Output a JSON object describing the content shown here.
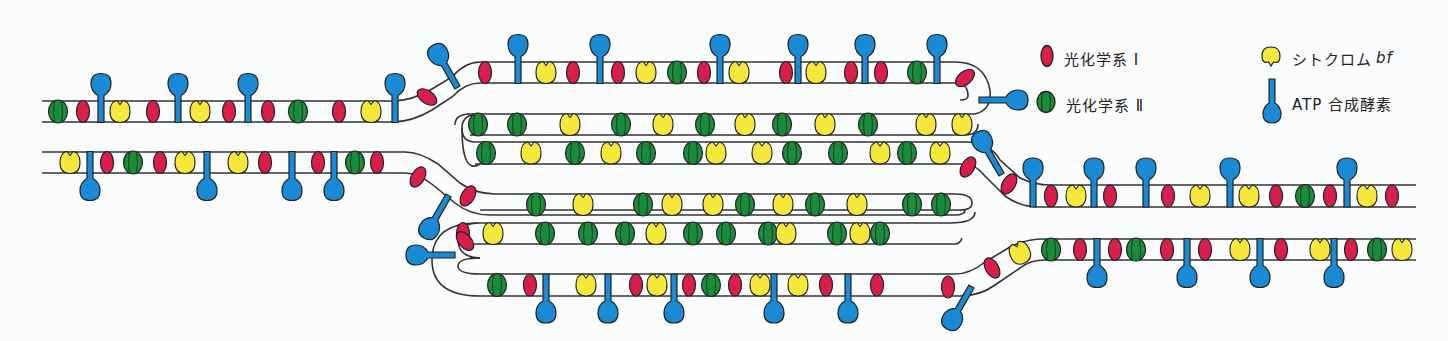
{
  "figure": {
    "colors": {
      "psi": "#d81e4a",
      "psii": "#1e8a3c",
      "cyt": "#f5e83a",
      "atp": "#1a8ad4",
      "stroke": "#222222",
      "membrane": "#333333",
      "background": "#fbfcfd"
    }
  },
  "legend": {
    "items": [
      {
        "key": "psi",
        "label": "光化学系 Ⅰ",
        "icon": "red-oval-icon"
      },
      {
        "key": "psii",
        "label": "光化学系 Ⅱ",
        "icon": "green-striped-oval-icon"
      },
      {
        "key": "cyt",
        "label": "シトクロム",
        "label_italic": "bf",
        "icon": "yellow-notched-icon"
      },
      {
        "key": "atp",
        "label": "ATP 合成酵素",
        "icon": "blue-lollipop-icon"
      }
    ]
  },
  "membranes": {
    "left_upper_lamella": {
      "y_top": 101,
      "y_bot": 122,
      "x_start": 42,
      "x_end": 392,
      "items": [
        {
          "t": "psii",
          "x": 58
        },
        {
          "t": "psi",
          "x": 83
        },
        {
          "t": "atp",
          "x": 101,
          "dir": "up"
        },
        {
          "t": "cyt",
          "x": 120
        },
        {
          "t": "psi",
          "x": 153
        },
        {
          "t": "atp",
          "x": 178,
          "dir": "up"
        },
        {
          "t": "cyt",
          "x": 200
        },
        {
          "t": "psi",
          "x": 229
        },
        {
          "t": "atp",
          "x": 248,
          "dir": "up"
        },
        {
          "t": "psi",
          "x": 268
        },
        {
          "t": "psii",
          "x": 298
        },
        {
          "t": "psi",
          "x": 339
        },
        {
          "t": "cyt",
          "x": 371
        },
        {
          "t": "atp",
          "x": 395,
          "dir": "up"
        }
      ]
    },
    "left_lower_lamella": {
      "y_top": 152,
      "y_bot": 173,
      "x_start": 42,
      "x_end": 405,
      "items": [
        {
          "t": "cyt",
          "x": 70
        },
        {
          "t": "atp",
          "x": 90,
          "dir": "down"
        },
        {
          "t": "psi",
          "x": 107
        },
        {
          "t": "psii",
          "x": 133
        },
        {
          "t": "psi",
          "x": 160
        },
        {
          "t": "cyt",
          "x": 185
        },
        {
          "t": "atp",
          "x": 207,
          "dir": "down"
        },
        {
          "t": "cyt",
          "x": 238
        },
        {
          "t": "psi",
          "x": 265
        },
        {
          "t": "atp",
          "x": 292,
          "dir": "down"
        },
        {
          "t": "psi",
          "x": 318
        },
        {
          "t": "atp",
          "x": 334,
          "dir": "down"
        },
        {
          "t": "psii",
          "x": 355
        },
        {
          "t": "psi",
          "x": 377
        }
      ]
    },
    "granum_top_outer": {
      "y_top": 62,
      "y_bot": 83,
      "x_start": 470,
      "x_end": 955,
      "items": [
        {
          "t": "psi",
          "x": 485
        },
        {
          "t": "atp",
          "x": 518,
          "dir": "up"
        },
        {
          "t": "cyt",
          "x": 546
        },
        {
          "t": "psi",
          "x": 573
        },
        {
          "t": "atp",
          "x": 600,
          "dir": "up"
        },
        {
          "t": "psi",
          "x": 618
        },
        {
          "t": "cyt",
          "x": 646
        },
        {
          "t": "psii",
          "x": 677
        },
        {
          "t": "psi",
          "x": 704
        },
        {
          "t": "atp",
          "x": 720,
          "dir": "up"
        },
        {
          "t": "cyt",
          "x": 739
        },
        {
          "t": "psi",
          "x": 786
        },
        {
          "t": "atp",
          "x": 798,
          "dir": "up"
        },
        {
          "t": "cyt",
          "x": 816
        },
        {
          "t": "psi",
          "x": 851
        },
        {
          "t": "atp",
          "x": 865,
          "dir": "up"
        },
        {
          "t": "psi",
          "x": 881
        },
        {
          "t": "psii",
          "x": 917
        },
        {
          "t": "atp",
          "x": 937,
          "dir": "up"
        }
      ]
    },
    "granum_upper_inner": {
      "y_top": 114,
      "y_bot": 135,
      "x_start": 465,
      "x_end": 960,
      "items": [
        {
          "t": "psii",
          "x": 478
        },
        {
          "t": "psii",
          "x": 517
        },
        {
          "t": "cyt",
          "x": 570
        },
        {
          "t": "psii",
          "x": 621
        },
        {
          "t": "cyt",
          "x": 663
        },
        {
          "t": "psii",
          "x": 705
        },
        {
          "t": "cyt",
          "x": 745
        },
        {
          "t": "psii",
          "x": 782
        },
        {
          "t": "cyt",
          "x": 825
        },
        {
          "t": "psii",
          "x": 868
        },
        {
          "t": "cyt",
          "x": 926
        },
        {
          "t": "cyt",
          "x": 962
        }
      ]
    },
    "granum_mid_a": {
      "y_top": 142,
      "y_bot": 164,
      "x_start": 465,
      "x_end": 960,
      "items": [
        {
          "t": "psii",
          "x": 486
        },
        {
          "t": "cyt",
          "x": 531
        },
        {
          "t": "psii",
          "x": 575
        },
        {
          "t": "cyt",
          "x": 611
        },
        {
          "t": "psii",
          "x": 646
        },
        {
          "t": "psii",
          "x": 693
        },
        {
          "t": "cyt",
          "x": 716
        },
        {
          "t": "cyt",
          "x": 762
        },
        {
          "t": "psii",
          "x": 792
        },
        {
          "t": "psii",
          "x": 838
        },
        {
          "t": "cyt",
          "x": 880
        },
        {
          "t": "psii",
          "x": 907
        },
        {
          "t": "cyt",
          "x": 940
        }
      ]
    },
    "granum_mid_b": {
      "y_top": 194,
      "y_bot": 215,
      "x_start": 470,
      "x_end": 960,
      "items": [
        {
          "t": "psii",
          "x": 536
        },
        {
          "t": "cyt",
          "x": 583
        },
        {
          "t": "psii",
          "x": 643
        },
        {
          "t": "cyt",
          "x": 672
        },
        {
          "t": "cyt",
          "x": 713
        },
        {
          "t": "psii",
          "x": 745
        },
        {
          "t": "cyt",
          "x": 783
        },
        {
          "t": "psii",
          "x": 815
        },
        {
          "t": "cyt",
          "x": 857
        },
        {
          "t": "psii",
          "x": 912
        },
        {
          "t": "psii",
          "x": 941
        }
      ]
    },
    "granum_lower_inner": {
      "y_top": 223,
      "y_bot": 244,
      "x_start": 460,
      "x_end": 960,
      "items": [
        {
          "t": "psi",
          "x": 463
        },
        {
          "t": "cyt",
          "x": 493
        },
        {
          "t": "psii",
          "x": 545
        },
        {
          "t": "psii",
          "x": 588
        },
        {
          "t": "psii",
          "x": 625
        },
        {
          "t": "cyt",
          "x": 656
        },
        {
          "t": "psii",
          "x": 693
        },
        {
          "t": "psii",
          "x": 726
        },
        {
          "t": "psii",
          "x": 768
        },
        {
          "t": "cyt",
          "x": 786
        },
        {
          "t": "psii",
          "x": 837
        },
        {
          "t": "cyt",
          "x": 860
        },
        {
          "t": "psii",
          "x": 880
        }
      ]
    },
    "granum_bottom_outer": {
      "y_top": 274,
      "y_bot": 296,
      "x_start": 470,
      "x_end": 960,
      "items": [
        {
          "t": "psii",
          "x": 497
        },
        {
          "t": "psi",
          "x": 530
        },
        {
          "t": "atp",
          "x": 546,
          "dir": "down"
        },
        {
          "t": "cyt",
          "x": 586
        },
        {
          "t": "atp",
          "x": 608,
          "dir": "down"
        },
        {
          "t": "psi",
          "x": 636
        },
        {
          "t": "cyt",
          "x": 657
        },
        {
          "t": "atp",
          "x": 674,
          "dir": "down"
        },
        {
          "t": "psi",
          "x": 689
        },
        {
          "t": "psii",
          "x": 711
        },
        {
          "t": "psi",
          "x": 735
        },
        {
          "t": "cyt",
          "x": 760
        },
        {
          "t": "atp",
          "x": 774,
          "dir": "down"
        },
        {
          "t": "cyt",
          "x": 798
        },
        {
          "t": "psi",
          "x": 826
        },
        {
          "t": "atp",
          "x": 848,
          "dir": "down"
        },
        {
          "t": "psi",
          "x": 877
        }
      ]
    },
    "right_upper_lamella": {
      "y_top": 185,
      "y_bot": 207,
      "x_start": 1030,
      "x_end": 1416,
      "items": [
        {
          "t": "atp",
          "x": 1033,
          "dir": "up"
        },
        {
          "t": "psi",
          "x": 1051
        },
        {
          "t": "cyt",
          "x": 1076
        },
        {
          "t": "atp",
          "x": 1094,
          "dir": "up"
        },
        {
          "t": "psi",
          "x": 1110
        },
        {
          "t": "atp",
          "x": 1146,
          "dir": "up"
        },
        {
          "t": "psi",
          "x": 1168
        },
        {
          "t": "cyt",
          "x": 1200
        },
        {
          "t": "atp",
          "x": 1230,
          "dir": "up"
        },
        {
          "t": "cyt",
          "x": 1249
        },
        {
          "t": "psi",
          "x": 1276
        },
        {
          "t": "psii",
          "x": 1305
        },
        {
          "t": "psi",
          "x": 1330
        },
        {
          "t": "atp",
          "x": 1347,
          "dir": "up"
        },
        {
          "t": "cyt",
          "x": 1367
        },
        {
          "t": "psi",
          "x": 1392
        }
      ]
    },
    "right_lower_lamella": {
      "y_top": 239,
      "y_bot": 260,
      "x_start": 1030,
      "x_end": 1416,
      "items": [
        {
          "t": "psii",
          "x": 1051
        },
        {
          "t": "psi",
          "x": 1080
        },
        {
          "t": "atp",
          "x": 1097,
          "dir": "down"
        },
        {
          "t": "psi",
          "x": 1115
        },
        {
          "t": "psii",
          "x": 1136
        },
        {
          "t": "psi",
          "x": 1167
        },
        {
          "t": "atp",
          "x": 1187,
          "dir": "down"
        },
        {
          "t": "psi",
          "x": 1205
        },
        {
          "t": "cyt",
          "x": 1240
        },
        {
          "t": "atp",
          "x": 1260,
          "dir": "down"
        },
        {
          "t": "psi",
          "x": 1281
        },
        {
          "t": "cyt",
          "x": 1320
        },
        {
          "t": "atp",
          "x": 1334,
          "dir": "down"
        },
        {
          "t": "psi",
          "x": 1351
        },
        {
          "t": "psii",
          "x": 1377
        },
        {
          "t": "cyt",
          "x": 1402
        }
      ]
    }
  },
  "connectors": {
    "items": [
      {
        "t": "psi",
        "x": 427,
        "y": 97,
        "rot": -55
      },
      {
        "t": "atp",
        "x": 452,
        "y": 78,
        "rot": -30,
        "dir": "up"
      },
      {
        "t": "psi",
        "x": 418,
        "y": 177,
        "rot": 30
      },
      {
        "t": "atp",
        "x": 443,
        "y": 205,
        "rot": 30,
        "dir": "down"
      },
      {
        "t": "psi",
        "x": 468,
        "y": 196,
        "rot": 30
      },
      {
        "t": "psi",
        "x": 465,
        "y": 241,
        "rot": -40
      },
      {
        "t": "atp",
        "x": 444,
        "y": 255,
        "rot": 0,
        "dir": "left"
      },
      {
        "t": "psi",
        "x": 965,
        "y": 78,
        "rot": 50
      },
      {
        "t": "atp",
        "x": 990,
        "y": 100,
        "rot": 0,
        "dir": "right"
      },
      {
        "t": "psi",
        "x": 968,
        "y": 167,
        "rot": 30
      },
      {
        "t": "atp",
        "x": 996,
        "y": 165,
        "rot": -30,
        "dir": "up"
      },
      {
        "t": "psi",
        "x": 1009,
        "y": 184,
        "rot": 30
      },
      {
        "t": "cyt",
        "x": 1020,
        "y": 253,
        "rot": -25
      },
      {
        "t": "psi",
        "x": 992,
        "y": 268,
        "rot": -30
      },
      {
        "t": "psi",
        "x": 948,
        "y": 287,
        "rot": 0
      },
      {
        "t": "atp",
        "x": 966,
        "y": 296,
        "rot": 30,
        "dir": "down"
      }
    ]
  }
}
